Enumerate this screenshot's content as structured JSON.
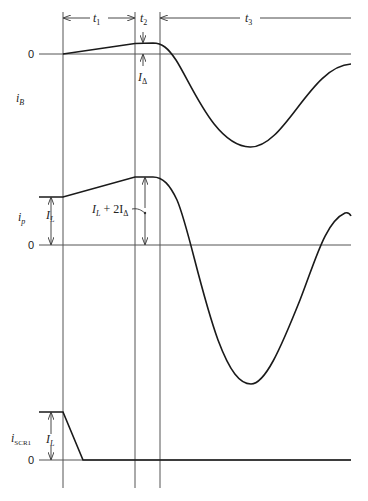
{
  "diagram": {
    "type": "waveform timing diagram",
    "intervals": [
      {
        "label": "t",
        "sub": "1"
      },
      {
        "label": "t",
        "sub": "2"
      },
      {
        "label": "t",
        "sub": "3"
      }
    ],
    "traces": [
      {
        "name": "i",
        "sub": "B",
        "zero_label": "0",
        "annotation": {
          "label": "I",
          "sub": "Δ"
        }
      },
      {
        "name": "i",
        "sub": "p",
        "zero_label": "0",
        "annotations": [
          {
            "label": "I",
            "sub": "L"
          },
          {
            "label": "I",
            "sub": "L",
            "suffix": " + 2I",
            "suffix_sub": "Δ"
          }
        ]
      },
      {
        "name": "i",
        "sub": "SCR1",
        "zero_label": "0",
        "annotation": {
          "label": "I",
          "sub": "L"
        }
      }
    ],
    "colors": {
      "line": "#1a1a1a",
      "grid": "#555555",
      "background": "#ffffff"
    }
  }
}
